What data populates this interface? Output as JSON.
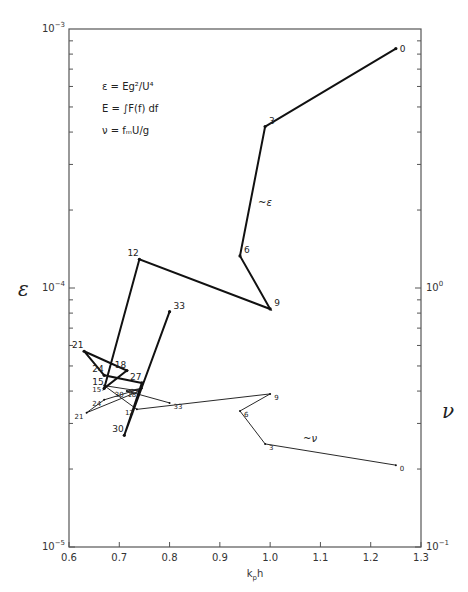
{
  "chart_data": {
    "type": "line",
    "title": "",
    "xlabel": "k_p h",
    "ylabel_left": "ε",
    "ylabel_right": "ν",
    "xlim": [
      0.6,
      1.3
    ],
    "ylim_left": [
      1e-05,
      0.001
    ],
    "ylim_right": [
      0.1,
      10.0
    ],
    "yscale": "log",
    "grid": false,
    "x_ticks": [
      "0.6",
      "0.7",
      "0.8",
      "0.9",
      "1.0",
      "1.1",
      "1.2",
      "1.3"
    ],
    "y_left_ticks": [
      "10^-5",
      "10^-4",
      "10^-3"
    ],
    "y_right_ticks": [
      "10^-1",
      "10^0"
    ],
    "annotations": [
      "ε = Eg²/U⁴",
      "E = ∫F(f) df",
      "ν = f_m U/g"
    ],
    "series": [
      {
        "name": "ε",
        "axis": "left",
        "style": "bold",
        "points": [
          {
            "label": "0",
            "x": 1.25,
            "y": 0.00084
          },
          {
            "label": "3",
            "x": 0.99,
            "y": 0.00042
          },
          {
            "label": "6",
            "x": 0.94,
            "y": 0.000133
          },
          {
            "label": "9",
            "x": 1.0,
            "y": 8.3e-05
          },
          {
            "label": "12",
            "x": 0.74,
            "y": 0.000129
          },
          {
            "label": "15",
            "x": 0.67,
            "y": 4.1e-05
          },
          {
            "label": "18",
            "x": 0.715,
            "y": 4.8e-05
          },
          {
            "label": "21",
            "x": 0.63,
            "y": 5.7e-05
          },
          {
            "label": "24",
            "x": 0.67,
            "y": 4.6e-05
          },
          {
            "label": "27",
            "x": 0.745,
            "y": 4.3e-05
          },
          {
            "label": "30",
            "x": 0.71,
            "y": 2.7e-05
          },
          {
            "label": "33",
            "x": 0.8,
            "y": 8.1e-05
          }
        ]
      },
      {
        "name": "ν",
        "axis": "right",
        "style": "thin",
        "points": [
          {
            "label": "0",
            "x": 1.25,
            "y": 0.207
          },
          {
            "label": "3",
            "x": 0.99,
            "y": 0.25
          },
          {
            "label": "6",
            "x": 0.94,
            "y": 0.335
          },
          {
            "label": "9",
            "x": 1.0,
            "y": 0.39
          },
          {
            "label": "12",
            "x": 0.735,
            "y": 0.34
          },
          {
            "label": "15",
            "x": 0.67,
            "y": 0.42
          },
          {
            "label": "18",
            "x": 0.74,
            "y": 0.4
          },
          {
            "label": "21",
            "x": 0.635,
            "y": 0.33
          },
          {
            "label": "24",
            "x": 0.67,
            "y": 0.37
          },
          {
            "label": "27",
            "x": 0.745,
            "y": 0.41
          },
          {
            "label": "30",
            "x": 0.715,
            "y": 0.4
          },
          {
            "label": "33",
            "x": 0.8,
            "y": 0.36
          }
        ]
      }
    ]
  },
  "labels": {
    "x_axis": "kph",
    "left_axis_symbol": "ε",
    "right_axis_symbol": "ν",
    "eq1": "ε  =  Eg²/U⁴",
    "eq2": "E  =  ∫F(f) df",
    "eq3": "ν  =  fₘU/g",
    "curve_eps": "ε",
    "curve_nu": "ν"
  }
}
